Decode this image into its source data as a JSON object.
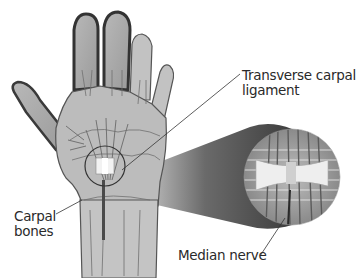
{
  "diagram": {
    "labels": [
      {
        "id": "transverse-carpal-ligament",
        "line1": "Transverse carpal",
        "line2": "ligament"
      },
      {
        "id": "carpal-bones",
        "line1": "Carpal",
        "line2": "bones"
      },
      {
        "id": "median-nerve",
        "line1": "Median nerve",
        "line2": ""
      }
    ],
    "callouts": {
      "magnified_region": "carpal tunnel close-up"
    },
    "colors": {
      "background": "#ffffff",
      "skin_fill": "#a9a9a9",
      "skin_outline": "#3a3a3a",
      "bone_fill": "#d0d0d0",
      "text": "#2a2a2a"
    }
  }
}
